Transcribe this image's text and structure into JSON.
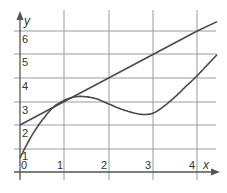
{
  "chart_data": {
    "type": "line",
    "title": "",
    "xlabel": "x",
    "ylabel": "y",
    "xlim": [
      0,
      4.45
    ],
    "ylim": [
      0,
      6.6
    ],
    "grid": true,
    "x_ticks": [
      "0",
      "1",
      "2",
      "3",
      "4"
    ],
    "y_ticks": [
      "1",
      "2",
      "3",
      "4",
      "5",
      "6"
    ],
    "series": [
      {
        "name": "tangent line",
        "x": [
          0,
          1,
          2,
          3,
          4,
          4.45
        ],
        "y": [
          2,
          3,
          4,
          5,
          6,
          6.4
        ]
      },
      {
        "name": "curve",
        "x": [
          0,
          0.25,
          0.5,
          0.75,
          1.0,
          1.25,
          1.5,
          1.75,
          2.0,
          2.25,
          2.5,
          2.75,
          3.0,
          3.25,
          3.5,
          3.75,
          4.0,
          4.25,
          4.45
        ],
        "y": [
          0.6,
          1.5,
          2.2,
          2.75,
          3.05,
          3.2,
          3.2,
          3.1,
          2.9,
          2.7,
          2.55,
          2.45,
          2.5,
          2.8,
          3.2,
          3.65,
          4.1,
          4.6,
          5.0
        ]
      }
    ],
    "annotations": [
      "line tangent to curve at about x = 1.1, y = 3.1"
    ]
  },
  "axes": {
    "x_label": "x",
    "y_label": "y",
    "x_tick_labels": [
      "0",
      "1",
      "2",
      "3",
      "4"
    ],
    "y_tick_labels": [
      "1",
      "2",
      "3",
      "4",
      "5",
      "6"
    ]
  }
}
